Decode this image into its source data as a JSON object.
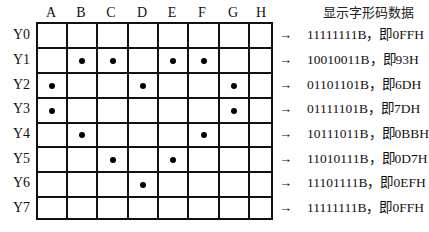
{
  "header": {
    "title": "显示字形码数据"
  },
  "columns": [
    "A",
    "B",
    "C",
    "D",
    "E",
    "F",
    "G",
    "H"
  ],
  "rows": [
    {
      "label": "Y0",
      "dots": [],
      "code": "11111111B，即0FFH"
    },
    {
      "label": "Y1",
      "dots": [
        1,
        2,
        4,
        5
      ],
      "code": "10010011B，即93H"
    },
    {
      "label": "Y2",
      "dots": [
        0,
        3,
        6
      ],
      "code": "01101101B，即6DH"
    },
    {
      "label": "Y3",
      "dots": [
        0,
        6
      ],
      "code": "01111101B，即7DH"
    },
    {
      "label": "Y4",
      "dots": [
        1,
        5
      ],
      "code": "10111011B，即0BBH"
    },
    {
      "label": "Y5",
      "dots": [
        2,
        4
      ],
      "code": "11010111B，即0D7H"
    },
    {
      "label": "Y6",
      "dots": [
        3
      ],
      "code": "11101111B，即0EFH"
    },
    {
      "label": "Y7",
      "dots": [],
      "code": "11111111B，即0FFH"
    }
  ],
  "arrow": "→"
}
